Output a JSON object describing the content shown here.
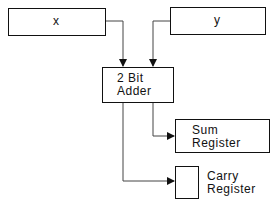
{
  "diagram": {
    "inputs": [
      {
        "id": "x",
        "label": "x"
      },
      {
        "id": "y",
        "label": "y"
      }
    ],
    "adder": {
      "line1": "2 Bit",
      "line2": "Adder"
    },
    "sum_register": {
      "line1": "Sum",
      "line2": "Register"
    },
    "carry_register": {
      "line1": "Carry",
      "line2": "Register"
    },
    "edges": [
      {
        "from": "x",
        "to": "adder"
      },
      {
        "from": "y",
        "to": "adder"
      },
      {
        "from": "adder",
        "to": "sum_register"
      },
      {
        "from": "adder",
        "to": "carry_register"
      }
    ],
    "stroke_color": "#111111"
  }
}
